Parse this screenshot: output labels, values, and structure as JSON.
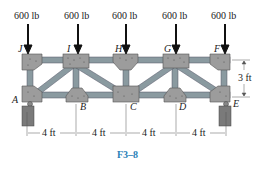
{
  "figure": {
    "caption": "F3–8",
    "loads": [
      {
        "node": "J",
        "label": "600 lb"
      },
      {
        "node": "I",
        "label": "600 lb"
      },
      {
        "node": "H",
        "label": "600 lb"
      },
      {
        "node": "G",
        "label": "600 lb"
      },
      {
        "node": "F",
        "label": "600 lb"
      }
    ],
    "nodes": {
      "top": [
        "J",
        "I",
        "H",
        "G",
        "F"
      ],
      "bottom": [
        "A",
        "B",
        "C",
        "D",
        "E"
      ]
    },
    "dimensions": {
      "height": "3 ft",
      "spans": [
        "4 ft",
        "4 ft",
        "4 ft",
        "4 ft"
      ]
    },
    "colors": {
      "member": "#8a9aa0",
      "gusset": "#9a9a9a",
      "support": "#7a7a7a",
      "caption": "#2a7fb8",
      "arrow": "#111111"
    }
  }
}
